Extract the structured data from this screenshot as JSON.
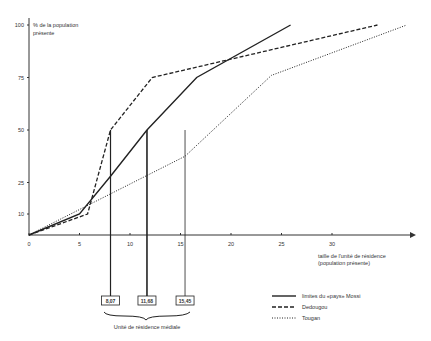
{
  "chart_data": {
    "type": "line",
    "title": "",
    "ylabel": "% de la population présente",
    "ylabel_lines": [
      "% de la population",
      "présente"
    ],
    "xlabel": "taille de l'unité de résidence (population présente)",
    "xlabel_lines": [
      "taille de l'unité de résidence",
      "(population présente)"
    ],
    "x_ticks": [
      0,
      5,
      10,
      15,
      20,
      25,
      30
    ],
    "y_ticks": [
      10,
      25,
      50,
      75,
      100
    ],
    "xlim": [
      0,
      38
    ],
    "ylim": [
      0,
      100
    ],
    "grid": false,
    "legend_position": "bottom-right",
    "series": [
      {
        "name": "limites du «pays» Mossi",
        "style": "solid",
        "x": [
          0,
          5,
          8.07,
          11.68,
          16.6,
          25.9
        ],
        "y": [
          0,
          10,
          28,
          50,
          75,
          100
        ]
      },
      {
        "name": "Dedougou",
        "style": "dashed",
        "x": [
          0,
          5.8,
          8.07,
          12.2,
          34.5
        ],
        "y": [
          0,
          10,
          50,
          75,
          100
        ]
      },
      {
        "name": "Tougan",
        "style": "dotted",
        "x": [
          0,
          15.45,
          24,
          37.4
        ],
        "y": [
          0,
          37.5,
          76,
          100
        ]
      }
    ],
    "annotations": {
      "median_lines": [
        {
          "x": 8.07,
          "label": "8,07",
          "series": "Dedougou",
          "y": 50
        },
        {
          "x": 11.68,
          "label": "11,68",
          "series": "limites du «pays» Mossi",
          "y": 50
        },
        {
          "x": 15.45,
          "label": "15,45",
          "series": "Tougan",
          "y": 50
        }
      ],
      "brace_label": "Unité de résidence médiale"
    }
  }
}
